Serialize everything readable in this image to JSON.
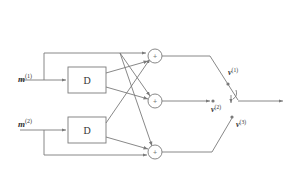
{
  "diagram": {
    "inputs": [
      {
        "symbol": "m",
        "superscript": "(1)"
      },
      {
        "symbol": "m",
        "superscript": "(2)"
      }
    ],
    "delay_blocks": [
      {
        "label": "D"
      },
      {
        "label": "D"
      }
    ],
    "adders": [
      {
        "symbol": "+"
      },
      {
        "symbol": "+"
      },
      {
        "symbol": "+"
      }
    ],
    "outputs": [
      {
        "symbol": "v",
        "superscript": "(1)"
      },
      {
        "symbol": "v",
        "superscript": "(2)"
      },
      {
        "symbol": "v",
        "superscript": "(3)"
      }
    ],
    "line_color": "#7a7a7a",
    "text_color": "#333333"
  }
}
